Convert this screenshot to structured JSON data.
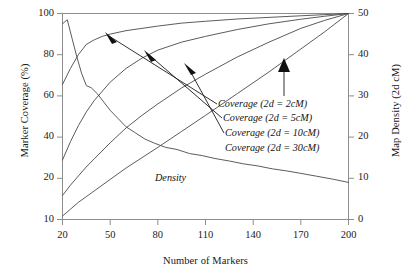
{
  "chart_data": {
    "type": "line",
    "title": "",
    "xlabel": "Number of Markers",
    "ylabel": "Marker Coverage (%)",
    "y2label": "Map Density (2d  cM)",
    "xlim": [
      20,
      200
    ],
    "ylim": [
      10,
      100
    ],
    "y2lim": [
      0,
      50
    ],
    "xticks": [
      20,
      50,
      80,
      110,
      140,
      170,
      200
    ],
    "yticks": [
      10,
      20,
      40,
      60,
      80,
      100
    ],
    "y2ticks": [
      0,
      10,
      20,
      30,
      40,
      50
    ],
    "grid": false,
    "legend_position": "inline-annotations",
    "series": [
      {
        "name": "Coverage (2d = 2cM)",
        "axis": "left",
        "x": [
          20,
          25,
          30,
          35,
          40,
          45,
          50,
          60,
          70,
          80,
          95,
          110,
          130,
          150,
          170,
          185,
          200
        ],
        "values": [
          69,
          76,
          82,
          86.5,
          88.5,
          90,
          91,
          92.5,
          93.5,
          94.5,
          95.8,
          96.6,
          97.6,
          98.3,
          99,
          99.5,
          100
        ]
      },
      {
        "name": "Coverage (2d = 5cM)",
        "axis": "left",
        "x": [
          20,
          25,
          30,
          35,
          40,
          50,
          60,
          70,
          80,
          95,
          110,
          130,
          150,
          170,
          185,
          200
        ],
        "values": [
          36,
          44,
          51,
          57,
          62,
          70,
          76,
          80.5,
          84,
          87.5,
          90,
          93,
          95.5,
          97.5,
          98.8,
          100
        ]
      },
      {
        "name": "Coverage (2d = 10cM)",
        "axis": "left",
        "x": [
          20,
          25,
          30,
          35,
          40,
          50,
          60,
          70,
          80,
          95,
          110,
          130,
          150,
          170,
          185,
          200
        ],
        "values": [
          20.5,
          25,
          29,
          33,
          36.5,
          43.5,
          50,
          55.5,
          60.5,
          67.5,
          73.5,
          81,
          87.5,
          93.5,
          97,
          100
        ]
      },
      {
        "name": "Coverage (2d = 30cM)",
        "axis": "left",
        "x": [
          20,
          25,
          30,
          35,
          40,
          50,
          60,
          70,
          80,
          95,
          110,
          130,
          150,
          170,
          185,
          200
        ],
        "values": [
          11.5,
          14.5,
          17.5,
          20,
          22.5,
          27.5,
          32.5,
          37,
          41.5,
          48.5,
          55.5,
          65,
          74.5,
          84.5,
          92,
          100
        ]
      },
      {
        "name": "Density",
        "axis": "right",
        "x": [
          20,
          23,
          26,
          29,
          32,
          35,
          38,
          42,
          46,
          50,
          55,
          60,
          66,
          72,
          78,
          85,
          92,
          100,
          108,
          116,
          125,
          134,
          143,
          152,
          161,
          170,
          180,
          190,
          200
        ],
        "values": [
          47.5,
          48.5,
          44,
          39.5,
          35.5,
          32.5,
          32,
          30.5,
          28.5,
          26.5,
          24.5,
          22.5,
          21,
          19.5,
          18.5,
          17.5,
          17,
          16,
          15.5,
          14.8,
          14.2,
          13.5,
          13,
          12.3,
          11.8,
          11.2,
          10.5,
          9.8,
          9
        ]
      }
    ],
    "annotations": [
      {
        "label": "Coverage (2d = 2cM)",
        "target_series": "Coverage (2d = 2cM)"
      },
      {
        "label": "Coverage (2d = 5cM)",
        "target_series": "Coverage (2d = 5cM)"
      },
      {
        "label": "Coverage (2d = 10cM)",
        "target_series": "Coverage (2d = 10cM)"
      },
      {
        "label": "Coverage (2d = 30cM)",
        "target_series": "Coverage (2d = 30cM)"
      },
      {
        "label": "Density",
        "target_series": "Density"
      }
    ]
  },
  "axes": {
    "left_title": "Marker Coverage (%)",
    "right_title": "Map Density (2d  cM)",
    "bottom_title": "Number of Markers",
    "left_ticks": [
      "100",
      "80",
      "60",
      "40",
      "20",
      "10"
    ],
    "right_ticks": [
      "50",
      "40",
      "30",
      "20",
      "10",
      "0"
    ],
    "bottom_ticks": [
      "20",
      "50",
      "80",
      "110",
      "140",
      "170",
      "200"
    ]
  },
  "labels": {
    "cov2": "Coverage (2d = 2cM)",
    "cov5": "Coverage (2d = 5cM)",
    "cov10": "Coverage (2d = 10cM)",
    "cov30": "Coverage (2d = 30cM)",
    "density": "Density"
  },
  "colors": {
    "line": "#4a4a4a",
    "frame": "#888888",
    "text": "#1b1b1b",
    "arrow": "#111111"
  }
}
